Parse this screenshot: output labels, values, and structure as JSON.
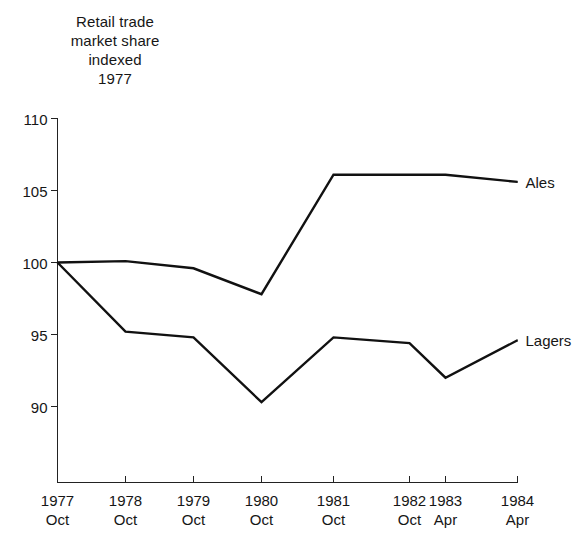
{
  "chart_data": {
    "type": "line",
    "title": "Retail trade market share indexed 1977",
    "title_lines": [
      "Retail trade",
      "market share",
      "indexed",
      "1977"
    ],
    "xlabel": "",
    "ylabel": "",
    "ylim": [
      86,
      110
    ],
    "yticks": [
      110,
      105,
      100,
      95,
      90
    ],
    "ytick_labels": [
      "110",
      "105",
      "100",
      "95",
      "90"
    ],
    "grid": false,
    "legend_position": "right-inline",
    "categories": [
      "1977 Oct",
      "1978 Oct",
      "1979 Oct",
      "1980 Oct",
      "1981 Oct",
      "1982 Oct",
      "1983 Apr",
      "1984 Apr"
    ],
    "xtick_year_labels": [
      "1977",
      "1978",
      "1979",
      "1980",
      "1981",
      "1982",
      "1983",
      "1984"
    ],
    "xtick_month_labels": [
      "Oct",
      "Oct",
      "Oct",
      "Oct",
      "Oct",
      "Oct",
      "Apr",
      "Apr"
    ],
    "series": [
      {
        "name": "Ales",
        "values": [
          100.0,
          100.1,
          99.6,
          97.8,
          106.1,
          106.1,
          106.1,
          105.6
        ]
      },
      {
        "name": "Lagers",
        "values": [
          100.0,
          95.2,
          94.8,
          90.3,
          94.8,
          94.4,
          92.0,
          94.6
        ]
      }
    ]
  }
}
